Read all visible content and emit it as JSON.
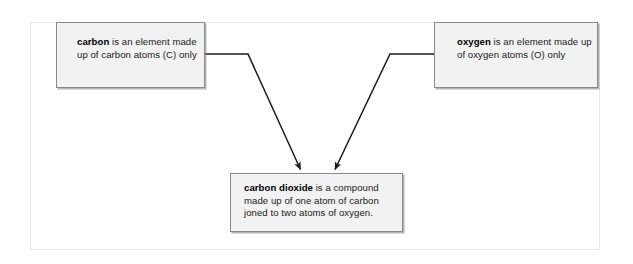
{
  "diagram": {
    "type": "concept-map",
    "topic": "Elements and compounds: carbon dioxide",
    "nodes": [
      {
        "id": "carbon",
        "term": "carbon",
        "body": " is an element made up of carbon atoms (C) only",
        "role": "element"
      },
      {
        "id": "oxygen",
        "term": "oxygen",
        "body": " is an element made up of oxygen atoms (O) only",
        "role": "element"
      },
      {
        "id": "carbon-dioxide",
        "term": "carbon dioxide",
        "body": " is a compound made up of one atom of carbon joned to two atoms of oxygen.",
        "role": "compound"
      }
    ],
    "connectors": [
      {
        "from": "carbon",
        "to": "carbon-dioxide",
        "style": "elbow-arrow"
      },
      {
        "from": "oxygen",
        "to": "carbon-dioxide",
        "style": "elbow-arrow"
      }
    ],
    "colors": {
      "box_fill": "#f2f2f2",
      "box_border": "#8a8a8a",
      "connector": "#1a1a1a",
      "page_frame": "#e8e8e8",
      "text": "#1a1a1a"
    }
  }
}
